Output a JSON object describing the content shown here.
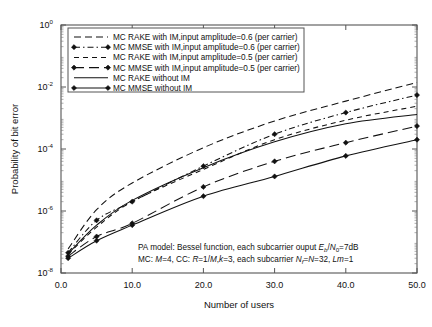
{
  "figure": {
    "ylabel": "Probability of bit error",
    "xlabel": "Number of users",
    "xticks": [
      "0.0",
      "10.0",
      "20.0",
      "30.0",
      "40.0",
      "50.0"
    ],
    "yticks": [
      "10",
      "10",
      "10",
      "10",
      "10"
    ],
    "yexp": [
      "0",
      "-2",
      "-4",
      "-6",
      "-8"
    ],
    "ghost_caption": ""
  },
  "legend": {
    "items": [
      {
        "label": "MC RAKE with IM,input amplitude=0.6 (per carrier)",
        "style": "dashed",
        "marker": "none"
      },
      {
        "label": "MC MMSE with IM,input amplitude=0.6 (per carrier)",
        "style": "dashdot",
        "marker": "diamond"
      },
      {
        "label": "MC RAKE with IM,input amplitude=0.5 (per carrier)",
        "style": "dashed-short",
        "marker": "none"
      },
      {
        "label": "MC MMSE with IM,input amplitude=0.5 (per carrier)",
        "style": "dashed-long",
        "marker": "diamond"
      },
      {
        "label": "MC RAKE without IM",
        "style": "solid",
        "marker": "none"
      },
      {
        "label": "MC MMSE without IM",
        "style": "solid",
        "marker": "diamond"
      }
    ]
  },
  "annotation": {
    "line1_a": "PA model: Bessel function, each subcarrier ouput ",
    "line1_E": "E",
    "line1_b": "b",
    "line1_slash": "/",
    "line1_N": "N",
    "line1_0": "0",
    "line1_end": "=7dB",
    "line2_a": "MC: ",
    "line2_M": "M",
    "line2_b": "=4, CC: ",
    "line2_R": "R",
    "line2_c": "=1/",
    "line2_M2": "M",
    "line2_d": ",",
    "line2_k": "k",
    "line2_e": "=3, each subcarrier ",
    "line2_N": "N",
    "line2_f": "f",
    "line2_g": "=",
    "line2_N2": "N",
    "line2_h": "=32, ",
    "line2_Lm": "Lm",
    "line2_i": "=1"
  },
  "chart_data": {
    "type": "line",
    "title": "",
    "xlabel": "Number of users",
    "ylabel": "Probability of bit error",
    "xlim": [
      0,
      50
    ],
    "ylim": [
      1e-08,
      1
    ],
    "yscale": "log",
    "xscale": "linear",
    "grid": false,
    "legend_position": "upper-left-inside",
    "x": [
      1,
      5,
      10,
      20,
      30,
      40,
      50
    ],
    "series": [
      {
        "name": "MC RAKE with IM,input amplitude=0.6 (per carrier)",
        "style": "dashed",
        "marker": "none",
        "values": [
          6e-08,
          1.1e-06,
          8e-06,
          0.00011,
          0.0008,
          0.0035,
          0.014
        ]
      },
      {
        "name": "MC MMSE with IM,input amplitude=0.6 (per carrier)",
        "style": "dashdot",
        "marker": "diamond",
        "values": [
          4.5e-08,
          5e-07,
          2e-06,
          2.8e-05,
          0.0003,
          0.0015,
          0.0055
        ]
      },
      {
        "name": "MC RAKE with IM,input amplitude=0.5 (per carrier)",
        "style": "dashed-short",
        "marker": "none",
        "values": [
          4e-08,
          3e-07,
          2e-06,
          2.2e-05,
          0.0002,
          0.00085,
          0.0024
        ]
      },
      {
        "name": "MC MMSE with IM,input amplitude=0.5 (per carrier)",
        "style": "dashed-long",
        "marker": "diamond",
        "values": [
          3.5e-08,
          1.5e-07,
          4e-07,
          6e-06,
          4e-05,
          0.00016,
          0.00055
        ]
      },
      {
        "name": "MC RAKE without IM",
        "style": "solid",
        "marker": "none",
        "values": [
          4.2e-08,
          3.5e-07,
          2.2e-06,
          2.5e-05,
          0.00017,
          0.00065,
          0.0013
        ]
      },
      {
        "name": "MC MMSE without IM",
        "style": "solid",
        "marker": "diamond",
        "values": [
          3e-08,
          1.1e-07,
          3.5e-07,
          3e-06,
          1.3e-05,
          6e-05,
          0.0002
        ]
      }
    ]
  }
}
